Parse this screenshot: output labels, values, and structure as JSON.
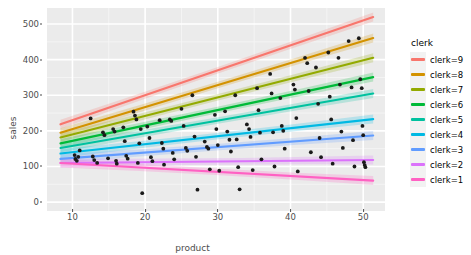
{
  "chart_data": {
    "type": "scatter",
    "title": "",
    "xlabel": "product",
    "ylabel": "sales",
    "xlim": [
      6.5,
      53
    ],
    "ylim": [
      -25,
      545
    ],
    "xticks": [
      10,
      20,
      30,
      40,
      50
    ],
    "yticks": [
      0,
      100,
      200,
      300,
      400,
      500
    ],
    "grid": true,
    "legend_position": "right",
    "legend_title": "clerk",
    "series": [
      {
        "name": "clerk=9",
        "color": "#f8766d",
        "fit": {
          "x0": 10,
          "y0": 230,
          "x1": 50,
          "y1": 510
        }
      },
      {
        "name": "clerk=8",
        "color": "#d39200",
        "fit": {
          "x0": 10,
          "y0": 205,
          "x1": 50,
          "y1": 452
        }
      },
      {
        "name": "clerk=7",
        "color": "#93aa00",
        "fit": {
          "x0": 10,
          "y0": 190,
          "x1": 50,
          "y1": 398
        }
      },
      {
        "name": "clerk=6",
        "color": "#00ba38",
        "fit": {
          "x0": 10,
          "y0": 172,
          "x1": 50,
          "y1": 345
        }
      },
      {
        "name": "clerk=5",
        "color": "#00c19f",
        "fit": {
          "x0": 10,
          "y0": 158,
          "x1": 50,
          "y1": 300
        }
      },
      {
        "name": "clerk=4",
        "color": "#00b9e3",
        "fit": {
          "x0": 10,
          "y0": 140,
          "x1": 50,
          "y1": 230
        }
      },
      {
        "name": "clerk=3",
        "color": "#619cff",
        "fit": {
          "x0": 10,
          "y0": 124,
          "x1": 50,
          "y1": 185
        }
      },
      {
        "name": "clerk=2",
        "color": "#db72fb",
        "fit": {
          "x0": 10,
          "y0": 110,
          "x1": 50,
          "y1": 118
        }
      },
      {
        "name": "clerk=1",
        "color": "#ff61c3",
        "fit": {
          "x0": 10,
          "y0": 108,
          "x1": 50,
          "y1": 62
        }
      }
    ],
    "points": [
      [
        10.3,
        132
      ],
      [
        10.4,
        121
      ],
      [
        10.6,
        116
      ],
      [
        10.8,
        127
      ],
      [
        11.0,
        145
      ],
      [
        12.5,
        235
      ],
      [
        12.8,
        128
      ],
      [
        13.0,
        118
      ],
      [
        13.4,
        110
      ],
      [
        14.2,
        196
      ],
      [
        14.4,
        188
      ],
      [
        14.9,
        123
      ],
      [
        15.6,
        205
      ],
      [
        15.8,
        198
      ],
      [
        16.0,
        116
      ],
      [
        16.1,
        108
      ],
      [
        17.0,
        210
      ],
      [
        17.2,
        171
      ],
      [
        17.4,
        130
      ],
      [
        17.6,
        122
      ],
      [
        18.4,
        254
      ],
      [
        18.6,
        243
      ],
      [
        18.8,
        232
      ],
      [
        19.0,
        110
      ],
      [
        19.2,
        165
      ],
      [
        19.4,
        205
      ],
      [
        19.6,
        25
      ],
      [
        20.3,
        212
      ],
      [
        20.6,
        180
      ],
      [
        20.8,
        126
      ],
      [
        21.0,
        115
      ],
      [
        22.0,
        230
      ],
      [
        22.3,
        166
      ],
      [
        22.5,
        150
      ],
      [
        22.6,
        105
      ],
      [
        23.4,
        232
      ],
      [
        23.6,
        228
      ],
      [
        23.8,
        138
      ],
      [
        24.0,
        120
      ],
      [
        25.0,
        262
      ],
      [
        25.3,
        214
      ],
      [
        25.6,
        152
      ],
      [
        25.8,
        144
      ],
      [
        26.5,
        300
      ],
      [
        26.8,
        184
      ],
      [
        27.0,
        127
      ],
      [
        27.2,
        35
      ],
      [
        28.2,
        170
      ],
      [
        28.5,
        155
      ],
      [
        28.7,
        150
      ],
      [
        28.9,
        92
      ],
      [
        29.6,
        245
      ],
      [
        29.8,
        205
      ],
      [
        30.0,
        160
      ],
      [
        30.2,
        88
      ],
      [
        31.0,
        255
      ],
      [
        31.3,
        198
      ],
      [
        31.6,
        175
      ],
      [
        31.8,
        142
      ],
      [
        32.4,
        300
      ],
      [
        32.6,
        176
      ],
      [
        32.8,
        98
      ],
      [
        33.0,
        36
      ],
      [
        34.0,
        218
      ],
      [
        34.3,
        205
      ],
      [
        34.5,
        183
      ],
      [
        34.8,
        90
      ],
      [
        35.4,
        320
      ],
      [
        35.6,
        258
      ],
      [
        35.8,
        195
      ],
      [
        36.0,
        120
      ],
      [
        37.2,
        360
      ],
      [
        37.4,
        305
      ],
      [
        37.6,
        196
      ],
      [
        37.8,
        100
      ],
      [
        38.6,
        292
      ],
      [
        38.8,
        214
      ],
      [
        39.0,
        200
      ],
      [
        39.2,
        150
      ],
      [
        40.4,
        330
      ],
      [
        40.6,
        316
      ],
      [
        40.8,
        236
      ],
      [
        41.0,
        86
      ],
      [
        42.0,
        405
      ],
      [
        42.3,
        390
      ],
      [
        42.5,
        312
      ],
      [
        42.8,
        140
      ],
      [
        43.5,
        378
      ],
      [
        43.8,
        276
      ],
      [
        44.0,
        180
      ],
      [
        44.2,
        126
      ],
      [
        45.2,
        420
      ],
      [
        45.4,
        296
      ],
      [
        45.6,
        232
      ],
      [
        45.8,
        108
      ],
      [
        46.6,
        405
      ],
      [
        46.8,
        330
      ],
      [
        47.0,
        198
      ],
      [
        47.2,
        152
      ],
      [
        48.0,
        452
      ],
      [
        48.4,
        322
      ],
      [
        48.6,
        174
      ],
      [
        48.8,
        100
      ],
      [
        49.4,
        460
      ],
      [
        49.6,
        345
      ],
      [
        49.8,
        320
      ],
      [
        49.9,
        214
      ],
      [
        50.0,
        188
      ],
      [
        50.1,
        112
      ],
      [
        50.2,
        104
      ],
      [
        50.3,
        98
      ]
    ]
  },
  "legend": {
    "title": "clerk",
    "items": [
      {
        "label": "clerk=9",
        "color": "#f8766d"
      },
      {
        "label": "clerk=8",
        "color": "#d39200"
      },
      {
        "label": "clerk=7",
        "color": "#93aa00"
      },
      {
        "label": "clerk=6",
        "color": "#00ba38"
      },
      {
        "label": "clerk=5",
        "color": "#00c19f"
      },
      {
        "label": "clerk=4",
        "color": "#00b9e3"
      },
      {
        "label": "clerk=3",
        "color": "#619cff"
      },
      {
        "label": "clerk=2",
        "color": "#db72fb"
      },
      {
        "label": "clerk=1",
        "color": "#ff61c3"
      }
    ]
  },
  "theme": {
    "panel_background": "#ebebeb",
    "grid_major": "#ffffff",
    "grid_minor": "#f5f5f5",
    "text_color": "#4d4d4d",
    "page_background": "#ffffff",
    "point_color": "#1a1a1a"
  }
}
